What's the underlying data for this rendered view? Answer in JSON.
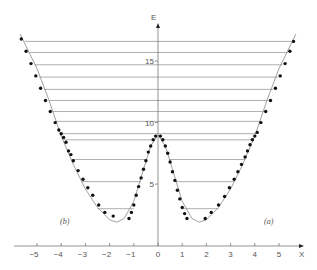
{
  "chart_data": {
    "type": "line",
    "title": "",
    "xlabel": "X",
    "ylabel": "E",
    "xlim": [
      -5.8,
      5.9
    ],
    "ylim": [
      0,
      17.5
    ],
    "grid": false,
    "x_ticks": [
      -5,
      -4,
      -3,
      -2,
      -1,
      0,
      1,
      2,
      3,
      4,
      5
    ],
    "x_tick_labels": [
      "−5",
      "−4",
      "−3",
      "−2",
      "−1",
      "0",
      "1",
      "2",
      "3",
      "4",
      "5"
    ],
    "y_ticks": [
      5,
      10,
      15
    ],
    "y_tick_labels": [
      "5",
      "10",
      "15"
    ],
    "annotations": [
      {
        "text": "(a)",
        "x": 3.7,
        "y": 1.1
      },
      {
        "text": "(b)",
        "x": -3.7,
        "y": 1.1
      }
    ],
    "series": [
      {
        "name": "potential curve",
        "style": "solid line",
        "x": [
          -5.7,
          -5.0,
          -4.5,
          -4.0,
          -3.5,
          -3.0,
          -2.5,
          -2.0,
          -1.7,
          -1.4,
          -1.0,
          -0.6,
          -0.3,
          0.0,
          0.3,
          0.6,
          1.0,
          1.4,
          1.7,
          2.0,
          2.5,
          3.0,
          3.5,
          4.0,
          4.5,
          5.0,
          5.7
        ],
        "values": [
          17.2,
          14.4,
          11.8,
          8.9,
          6.6,
          4.6,
          3.1,
          2.1,
          1.9,
          2.2,
          3.6,
          6.2,
          8.1,
          9.0,
          8.1,
          6.2,
          3.6,
          2.2,
          1.9,
          2.1,
          3.1,
          4.6,
          6.6,
          8.9,
          11.8,
          14.4,
          17.2
        ]
      },
      {
        "name": "data points",
        "style": "markers",
        "x": [
          -5.65,
          -5.45,
          -5.25,
          -5.05,
          -4.85,
          -4.65,
          -4.45,
          -4.25,
          -4.1,
          -4.0,
          -3.9,
          -3.8,
          -3.7,
          -3.6,
          -3.5,
          -3.3,
          -3.1,
          -2.9,
          -2.7,
          -2.45,
          -2.2,
          -1.85,
          -1.2,
          -1.1,
          -1.0,
          -0.9,
          -0.8,
          -0.7,
          -0.6,
          -0.5,
          -0.4,
          -0.3,
          -0.2,
          -0.1,
          0.1,
          0.2,
          0.3,
          0.4,
          0.5,
          0.6,
          0.7,
          0.8,
          0.9,
          1.0,
          1.1,
          1.2,
          1.95,
          2.2,
          2.5,
          2.75,
          2.95,
          3.15,
          3.3,
          3.45,
          3.6,
          3.7,
          3.8,
          3.9,
          4.0,
          4.1,
          4.25,
          4.45,
          4.65,
          4.85,
          5.05,
          5.25,
          5.45,
          5.6
        ],
        "values": [
          16.8,
          15.8,
          14.8,
          13.8,
          12.8,
          11.8,
          10.9,
          10.0,
          9.4,
          9.1,
          8.8,
          8.4,
          7.7,
          7.4,
          6.9,
          6.1,
          5.4,
          4.7,
          4.1,
          3.3,
          2.7,
          2.4,
          2.2,
          2.7,
          3.3,
          4.1,
          4.8,
          5.5,
          6.2,
          6.9,
          7.6,
          8.1,
          8.6,
          8.9,
          8.9,
          8.6,
          8.1,
          7.5,
          6.8,
          6.0,
          5.3,
          4.5,
          3.8,
          3.1,
          2.6,
          2.2,
          2.2,
          2.7,
          3.3,
          4.0,
          4.7,
          5.4,
          6.0,
          6.6,
          7.2,
          7.7,
          8.2,
          8.6,
          8.9,
          9.2,
          10.0,
          10.9,
          11.8,
          12.8,
          13.8,
          14.8,
          15.8,
          16.6
        ]
      },
      {
        "name": "energy levels",
        "style": "horizontal lines",
        "levels": [
          {
            "E": 16.6,
            "x_from": -5.5,
            "x_to": 5.5
          },
          {
            "E": 15.7,
            "x_from": -5.3,
            "x_to": 5.35
          },
          {
            "E": 14.7,
            "x_from": -5.1,
            "x_to": 5.15
          },
          {
            "E": 13.7,
            "x_from": -4.9,
            "x_to": 4.95
          },
          {
            "E": 12.7,
            "x_from": -4.7,
            "x_to": 4.75
          },
          {
            "E": 11.8,
            "x_from": -4.5,
            "x_to": 4.55
          },
          {
            "E": 10.9,
            "x_from": -4.35,
            "x_to": 4.4
          },
          {
            "E": 10.1,
            "x_from": -4.2,
            "x_to": 4.25
          },
          {
            "E": 9.1,
            "x_from": -4.0,
            "x_to": 4.05
          },
          {
            "E": 8.6,
            "x_from": -3.95,
            "x_to": -0.15
          },
          {
            "E": 8.6,
            "x_from": 0.15,
            "x_to": 3.95
          },
          {
            "E": 7.0,
            "x_from": -3.6,
            "x_to": -0.45
          },
          {
            "E": 7.0,
            "x_from": 0.45,
            "x_to": 3.6
          },
          {
            "E": 5.2,
            "x_from": -3.15,
            "x_to": -0.7
          },
          {
            "E": 5.2,
            "x_from": 0.7,
            "x_to": 3.15
          },
          {
            "E": 3.0,
            "x_from": -2.5,
            "x_to": -1.0
          },
          {
            "E": 3.0,
            "x_from": 1.0,
            "x_to": 2.5
          }
        ]
      }
    ]
  },
  "labels": {
    "y_axis_name": "E",
    "x_axis_name": "X",
    "panel_a": "(a)",
    "panel_b": "(b)"
  },
  "colors": {
    "axis": "#777777",
    "curve": "#888888",
    "level_line": "#9a9a9a",
    "marker": "#111111",
    "text": "#555555"
  }
}
